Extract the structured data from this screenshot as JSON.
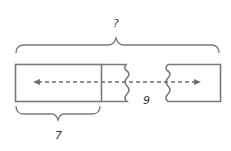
{
  "diagram": {
    "type": "tape-diagram",
    "labels": {
      "total": "?",
      "part_known": "7",
      "remaining": "9"
    },
    "colors": {
      "stroke": "#7a7a7a",
      "dash": "#6e6e6e",
      "text": "#333333",
      "background": "#ffffff"
    }
  }
}
